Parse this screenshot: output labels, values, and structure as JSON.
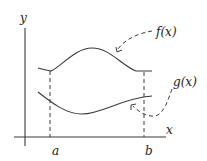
{
  "diagram": {
    "axes": {
      "x_label": "x",
      "y_label": "y"
    },
    "bounds": {
      "a_label": "a",
      "b_label": "b"
    },
    "curves": [
      {
        "name": "upper",
        "label": "f(x)"
      },
      {
        "name": "lower",
        "label": "g(x)"
      }
    ],
    "colors": {
      "stroke": "#3a3a3a",
      "background": "#ffffff"
    }
  }
}
